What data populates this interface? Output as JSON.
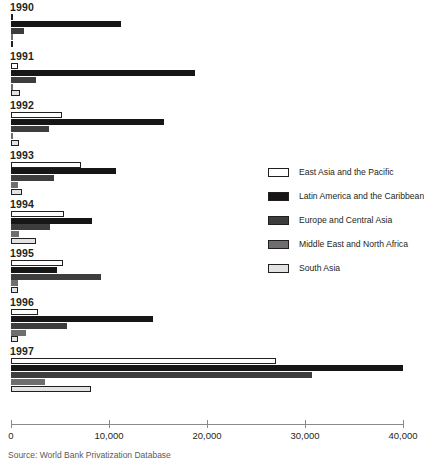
{
  "source_note": "Source: World Bank Privatization Database",
  "legend": {
    "position": "right",
    "entries": [
      {
        "label": "East Asia and the Pacific",
        "color": "#ffffff"
      },
      {
        "label": "Latin America and the Caribbean",
        "color": "#161616"
      },
      {
        "label": "Europe and Central Asia",
        "color": "#3d3d3d"
      },
      {
        "label": "Middle East and North Africa",
        "color": "#6e6e6e"
      },
      {
        "label": "South Asia",
        "color": "#e3e3e3"
      }
    ]
  },
  "axis": {
    "ticks": [
      {
        "value": 0,
        "label": "0"
      },
      {
        "value": 10000,
        "label": "10,000"
      },
      {
        "value": 20000,
        "label": "20,000"
      },
      {
        "value": 30000,
        "label": "30,000"
      },
      {
        "value": 40000,
        "label": "40,000"
      }
    ]
  },
  "chart_data": {
    "type": "bar",
    "orientation": "horizontal",
    "title": "",
    "subtitle": "",
    "xlabel": "",
    "ylabel": "",
    "xlim": [
      0,
      40000
    ],
    "grid": false,
    "legend_position": "right",
    "categories": [
      "1990",
      "1991",
      "1992",
      "1993",
      "1994",
      "1995",
      "1996",
      "1997"
    ],
    "series": [
      {
        "name": "East Asia and the Pacific",
        "color": "#ffffff",
        "values": [
          250,
          700,
          5200,
          7100,
          5400,
          5300,
          2800,
          27000
        ]
      },
      {
        "name": "Latin America and the Caribbean",
        "color": "#161616",
        "values": [
          11200,
          18800,
          15600,
          10700,
          8300,
          4700,
          14500,
          40000
        ]
      },
      {
        "name": "Europe and Central Asia",
        "color": "#3d3d3d",
        "values": [
          1350,
          2500,
          3900,
          4400,
          4000,
          9200,
          5700,
          30700
        ]
      },
      {
        "name": "Middle East and North Africa",
        "color": "#6e6e6e",
        "values": [
          60,
          120,
          160,
          700,
          800,
          750,
          1500,
          3500
        ]
      },
      {
        "name": "South Asia",
        "color": "#e3e3e3",
        "values": [
          60,
          900,
          800,
          1100,
          2500,
          700,
          700,
          8200
        ]
      }
    ]
  }
}
